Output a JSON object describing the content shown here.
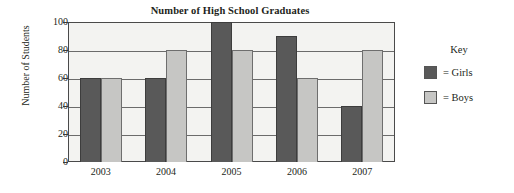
{
  "chart_data": {
    "type": "bar",
    "title": "Number of High School Graduates",
    "xlabel": "",
    "ylabel": "Number of Students",
    "categories": [
      "2003",
      "2004",
      "2005",
      "2006",
      "2007"
    ],
    "series": [
      {
        "name": "Girls",
        "values": [
          60,
          60,
          100,
          90,
          40
        ],
        "color": "#595959"
      },
      {
        "name": "Boys",
        "values": [
          60,
          80,
          80,
          60,
          80
        ],
        "color": "#c6c6c4"
      }
    ],
    "ylim": [
      0,
      100
    ],
    "yticks": [
      0,
      20,
      40,
      60,
      80,
      100
    ],
    "grid": true,
    "legend_position": "right",
    "legend_title": "Key",
    "legend_entries": [
      "= Girls",
      "= Boys"
    ]
  },
  "legend": {
    "title": "Key",
    "items": [
      {
        "label": "= Girls",
        "swatch": "girls-swatch"
      },
      {
        "label": "= Boys",
        "swatch": "boys-swatch"
      }
    ]
  }
}
